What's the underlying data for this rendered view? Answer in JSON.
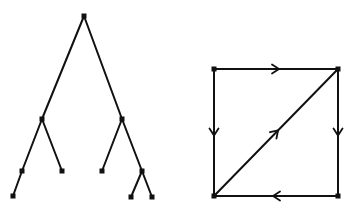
{
  "figure": {
    "width": 354,
    "height": 213,
    "background": "#ffffff",
    "stroke_color": "#111111"
  },
  "tree": {
    "nodes": [
      {
        "id": "root",
        "x": 84,
        "y": 16
      },
      {
        "id": "L",
        "x": 42,
        "y": 119
      },
      {
        "id": "R",
        "x": 122,
        "y": 119
      },
      {
        "id": "LL",
        "x": 22,
        "y": 171
      },
      {
        "id": "LR",
        "x": 62,
        "y": 171
      },
      {
        "id": "RL",
        "x": 102,
        "y": 171
      },
      {
        "id": "RR",
        "x": 142,
        "y": 171
      },
      {
        "id": "LLL",
        "x": 13,
        "y": 196
      },
      {
        "id": "RRL",
        "x": 131,
        "y": 197
      },
      {
        "id": "RRR",
        "x": 152,
        "y": 197
      }
    ],
    "edges": [
      [
        "root",
        "L"
      ],
      [
        "root",
        "R"
      ],
      [
        "L",
        "LL"
      ],
      [
        "L",
        "LR"
      ],
      [
        "R",
        "RL"
      ],
      [
        "R",
        "RR"
      ],
      [
        "LL",
        "LLL"
      ],
      [
        "RR",
        "RRL"
      ],
      [
        "RR",
        "RRR"
      ]
    ]
  },
  "graph": {
    "nodes": [
      {
        "id": "TL",
        "x": 214,
        "y": 69
      },
      {
        "id": "TR",
        "x": 338,
        "y": 69
      },
      {
        "id": "BL",
        "x": 214,
        "y": 196
      },
      {
        "id": "BR",
        "x": 338,
        "y": 196
      }
    ],
    "edges": [
      {
        "from": "TL",
        "to": "TR",
        "directed": true
      },
      {
        "from": "TL",
        "to": "BL",
        "directed": true
      },
      {
        "from": "TR",
        "to": "BR",
        "directed": true
      },
      {
        "from": "BR",
        "to": "BL",
        "directed": true
      },
      {
        "from": "BL",
        "to": "TR",
        "directed": true
      }
    ]
  }
}
